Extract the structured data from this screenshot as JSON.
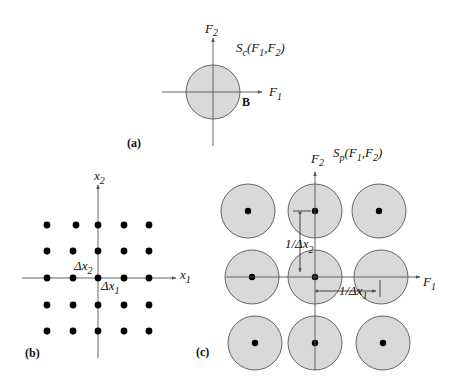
{
  "panel_a": {
    "label": "(a)",
    "axis_x": {
      "name": "F",
      "sub": "1"
    },
    "axis_y": {
      "name": "F",
      "sub": "2"
    },
    "spectrum": {
      "name": "S",
      "sub": "c",
      "args_open": "(F",
      "arg1_sub": "1",
      "sep": ",F",
      "arg2_sub": "2",
      "close": ")"
    },
    "boundary_label": "B",
    "fill_color": "#d9d9d9"
  },
  "panel_b": {
    "label": "(b)",
    "axis_x": {
      "name": "x",
      "sub": "1"
    },
    "axis_y": {
      "name": "x",
      "sub": "2"
    },
    "delta_x1": {
      "name": "Δx",
      "sub": "1"
    },
    "delta_x2": {
      "name": "Δx",
      "sub": "2"
    },
    "grid": "5x5 sample lattice"
  },
  "panel_c": {
    "label": "(c)",
    "axis_x": {
      "name": "F",
      "sub": "1"
    },
    "axis_y": {
      "name": "F",
      "sub": "2"
    },
    "spectrum": {
      "name": "S",
      "sub": "p",
      "args_open": "(F",
      "arg1_sub": "1",
      "sep": ",F",
      "arg2_sub": "2",
      "close": ")"
    },
    "period_1": {
      "name": "1/Δx",
      "sub": "1"
    },
    "period_2": {
      "name": "1/Δx",
      "sub": "2"
    },
    "grid": "3x3 periodic replicas",
    "fill_color": "#d9d9d9"
  }
}
